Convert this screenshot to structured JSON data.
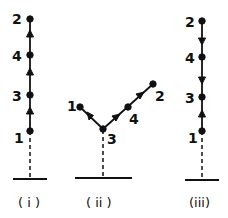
{
  "diagram": {
    "ink_color": "#111111",
    "background": "#ffffff",
    "panels": [
      {
        "caption": "( i )",
        "nodes": [
          {
            "label": "2",
            "x": 30,
            "y": 19
          },
          {
            "label": "4",
            "x": 30,
            "y": 55
          },
          {
            "label": "3",
            "x": 30,
            "y": 95
          },
          {
            "label": "1",
            "x": 30,
            "y": 131
          }
        ],
        "arrows": [
          "1→3 up",
          "3→4 up",
          "4→2 up"
        ]
      },
      {
        "caption": "( ii )",
        "nodes": [
          {
            "label": "1",
            "x": 80,
            "y": 107
          },
          {
            "label": "3",
            "x": 103,
            "y": 129
          },
          {
            "label": "4",
            "x": 128,
            "y": 107
          },
          {
            "label": "2",
            "x": 153,
            "y": 84
          }
        ],
        "arrows": [
          "3→1",
          "3→4",
          "4→2"
        ]
      },
      {
        "caption": "(iii)",
        "nodes": [
          {
            "label": "2",
            "x": 202,
            "y": 21
          },
          {
            "label": "4",
            "x": 202,
            "y": 57
          },
          {
            "label": "3",
            "x": 202,
            "y": 97
          },
          {
            "label": "1",
            "x": 202,
            "y": 131
          }
        ],
        "arrows": [
          "2→4 down",
          "4→3 down",
          "1→3 up"
        ]
      }
    ]
  }
}
